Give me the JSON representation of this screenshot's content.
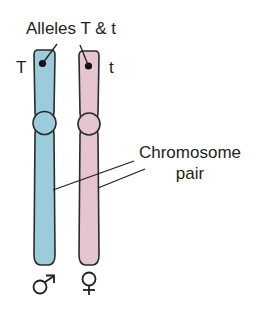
{
  "diagram": {
    "title_label": "Alleles T & t",
    "left_allele": "T",
    "right_allele": "t",
    "pair_label_line1": "Chromosome",
    "pair_label_line2": "pair",
    "male_symbol": "♂",
    "female_symbol": "♀"
  },
  "colors": {
    "male_chromosome": "#9ccbdb",
    "female_chromosome": "#e6c5d3",
    "outline": "#2b2b2b",
    "text": "#231f20",
    "background": "#ffffff"
  },
  "chromosomes": [
    {
      "name": "male-chromosome",
      "sex": "male",
      "allele": "T"
    },
    {
      "name": "female-chromosome",
      "sex": "female",
      "allele": "t"
    }
  ]
}
